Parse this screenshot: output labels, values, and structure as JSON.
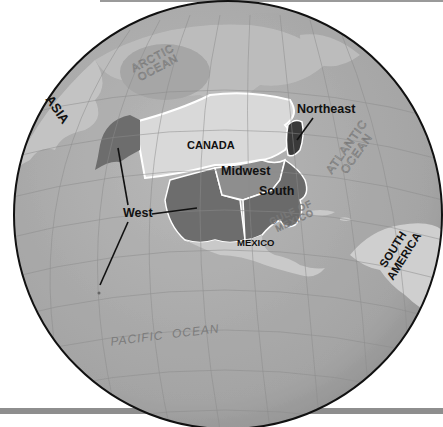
{
  "map": {
    "title": "United States Regions on Globe",
    "colors": {
      "background": "#ffffff",
      "ocean": "#a9a9a9",
      "land_other": "#c9c9c9",
      "canada": "#d9d9d9",
      "region_west": "#6e6e6e",
      "region_midwest": "#8f8f8f",
      "region_south": "#6a6a6a",
      "region_northeast": "#3a3a3a",
      "border": "#ffffff",
      "graticule": "#8c8c8c",
      "globe_outline": "#111111",
      "bar": "#8e8e8e"
    },
    "regions": [
      {
        "name": "West"
      },
      {
        "name": "Midwest"
      },
      {
        "name": "South"
      },
      {
        "name": "Northeast"
      }
    ],
    "labels": {
      "asia": "ASIA",
      "arctic_ocean_1": "ARCTIC",
      "arctic_ocean_2": "OCEAN",
      "canada": "CANADA",
      "northeast": "Northeast",
      "midwest": "Midwest",
      "south": "South",
      "west": "West",
      "mexico": "MEXICO",
      "gulf_1": "GULF OF",
      "gulf_2": "MEXICO",
      "atlantic_1": "ATLANTIC",
      "atlantic_2": "OCEAN",
      "south_america_1": "SOUTH",
      "south_america_2": "AMERICA",
      "pacific_ocean": "PACIFIC  OCEAN"
    }
  }
}
